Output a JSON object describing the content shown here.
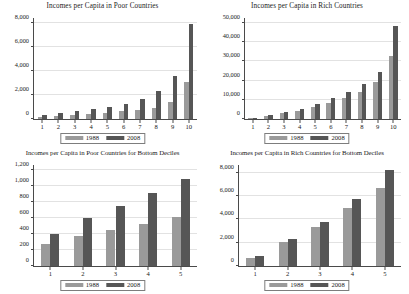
{
  "figure": {
    "series_labels": [
      "1988",
      "2008"
    ],
    "colors": {
      "series_1988": "#9a9a9a",
      "series_2008": "#565656",
      "axis": "#4a4a4a",
      "grid": "#e2e2e2"
    }
  },
  "chart_data": [
    {
      "type": "bar",
      "title": "Incomes per Capita in Poor Countries",
      "xlabel": "",
      "ylabel": "",
      "categories": [
        "1",
        "2",
        "3",
        "4",
        "5",
        "6",
        "7",
        "8",
        "9",
        "10"
      ],
      "ytick_labels": [
        "0",
        "2,000",
        "4,000",
        "6,000",
        "8,000"
      ],
      "ytick_values": [
        0,
        2000,
        4000,
        6000,
        8000
      ],
      "ylim": [
        0,
        8400
      ],
      "grid": true,
      "legend_position": "bottom-center",
      "series": [
        {
          "name": "1988",
          "values": [
            190,
            280,
            360,
            450,
            540,
            640,
            760,
            950,
            1400,
            3100
          ]
        },
        {
          "name": "2008",
          "values": [
            360,
            500,
            650,
            800,
            1000,
            1250,
            1650,
            2330,
            3550,
            7900
          ]
        }
      ]
    },
    {
      "type": "bar",
      "title": "Incomes per Capita in Rich Countries",
      "xlabel": "",
      "ylabel": "",
      "categories": [
        "1",
        "2",
        "3",
        "4",
        "5",
        "6",
        "7",
        "8",
        "9",
        "10"
      ],
      "ytick_labels": [
        "0",
        "10,000",
        "20,000",
        "30,000",
        "40,000",
        "50,000"
      ],
      "ytick_values": [
        0,
        10000,
        20000,
        30000,
        40000,
        50000
      ],
      "ylim": [
        0,
        52500
      ],
      "grid": true,
      "legend_position": "bottom-center",
      "series": [
        {
          "name": "1988",
          "values": [
            400,
            1700,
            3000,
            4300,
            6200,
            8500,
            10800,
            14000,
            19000,
            32800
          ]
        },
        {
          "name": "2008",
          "values": [
            700,
            2000,
            3700,
            5200,
            7900,
            11000,
            14200,
            18000,
            24200,
            48200
          ]
        }
      ]
    },
    {
      "type": "bar",
      "title": "Incomes per Capita in Poor Countries for Bottom Deciles",
      "xlabel": "",
      "ylabel": "",
      "categories": [
        "1",
        "2",
        "3",
        "4",
        "5"
      ],
      "ytick_labels": [
        "0",
        "200",
        "400",
        "600",
        "800",
        "1,000",
        "1,200"
      ],
      "ytick_values": [
        0,
        200,
        400,
        600,
        800,
        1000,
        1200
      ],
      "ylim": [
        0,
        1260
      ],
      "grid": true,
      "legend_position": "bottom-center",
      "series": [
        {
          "name": "1988",
          "values": [
            270,
            375,
            455,
            530,
            615
          ]
        },
        {
          "name": "2008",
          "values": [
            405,
            600,
            745,
            910,
            1090
          ]
        }
      ]
    },
    {
      "type": "bar",
      "title": "Incomes per Capita in Rich Countries for Bottom Deciles",
      "xlabel": "",
      "ylabel": "",
      "categories": [
        "1",
        "2",
        "3",
        "4",
        "5"
      ],
      "ytick_labels": [
        "0",
        "2,000",
        "4,000",
        "6,000",
        "8,000"
      ],
      "ytick_values": [
        0,
        2000,
        4000,
        6000,
        8000
      ],
      "ylim": [
        0,
        8650
      ],
      "grid": true,
      "legend_position": "bottom-center",
      "series": [
        {
          "name": "1988",
          "values": [
            670,
            2080,
            3380,
            4930,
            6650
          ]
        },
        {
          "name": "2008",
          "values": [
            900,
            2320,
            3800,
            5700,
            8250
          ]
        }
      ]
    }
  ]
}
